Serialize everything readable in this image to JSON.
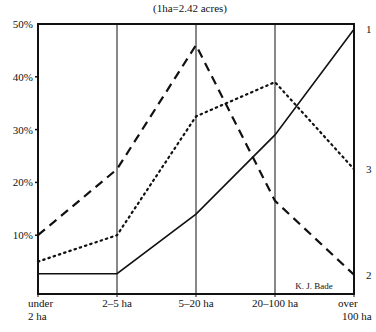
{
  "chart_data": {
    "type": "line",
    "title": "(1ha=2.42 acres)",
    "xlabel": "",
    "ylabel": "",
    "categories": [
      "under 2 ha",
      "2–5 ha",
      "5–20 ha",
      "20–100 ha",
      "over 100 ha"
    ],
    "category_lines": [
      [
        "under",
        "2 ha"
      ],
      [
        "2–5 ha"
      ],
      [
        "5–20 ha"
      ],
      [
        "20–100 ha"
      ],
      [
        "over",
        "100 ha"
      ]
    ],
    "yticks": [
      "10%",
      "20%",
      "30%",
      "40%",
      "50%"
    ],
    "ytick_values": [
      10,
      20,
      30,
      40,
      50
    ],
    "ylim": [
      0,
      50
    ],
    "grid": "vertical lines at each category",
    "series": [
      {
        "name": "1",
        "style": "solid",
        "values": [
          2.7,
          2.7,
          14,
          29,
          49
        ]
      },
      {
        "name": "2",
        "style": "dashed",
        "values": [
          10,
          22.5,
          46,
          16.5,
          2.5
        ]
      },
      {
        "name": "3",
        "style": "dotted",
        "values": [
          5,
          10,
          32.5,
          39,
          22.5
        ]
      }
    ],
    "annotation": "K. J. Bade",
    "legend_position": "series numbers at right end of lines"
  },
  "colors": {
    "ink": "#111111",
    "background": "#ffffff"
  }
}
